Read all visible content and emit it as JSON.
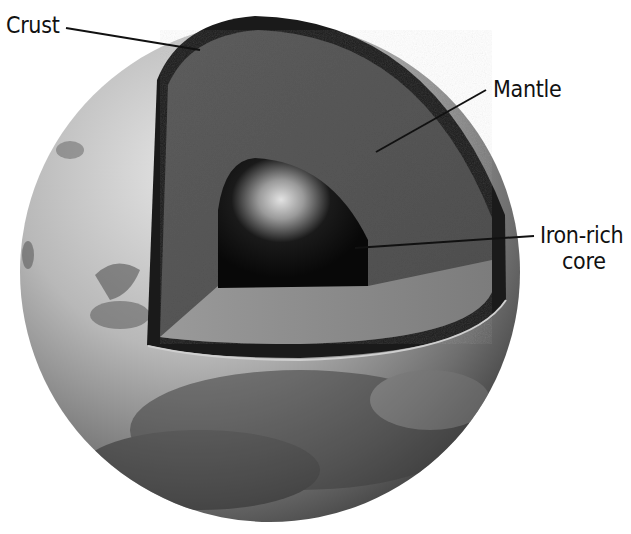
{
  "diagram": {
    "labels": {
      "crust": "Crust",
      "mantle": "Mantle",
      "core_line1": "Iron-rich",
      "core_line2": "core"
    },
    "colors": {
      "background": "#ffffff",
      "surface_light": "#d9d9d9",
      "surface_dark": "#4a4a4a",
      "crust": "#1c1c1c",
      "mantle": "#585858",
      "mantle_floor": "#8a8a8a",
      "core": "#0d0d0d",
      "core_highlight": "#d8d8d8",
      "leader_line": "#111111"
    }
  }
}
